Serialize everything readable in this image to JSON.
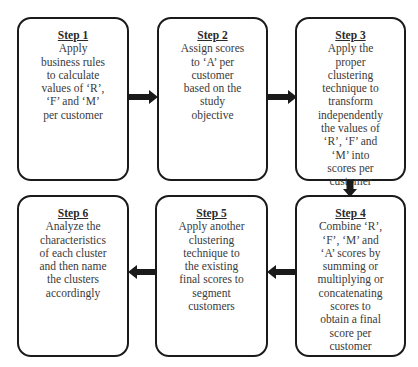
{
  "diagram": {
    "steps": [
      {
        "title": "Step 1",
        "text": "Apply\nbusiness rules\nto calculate\nvalues of ‘R’,\n‘F’ and ‘M’\nper customer"
      },
      {
        "title": "Step 2",
        "text": "Assign scores\nto ‘A’ per\ncustomer\nbased on the\nstudy\nobjective"
      },
      {
        "title": "Step 3",
        "text": "Apply the\nproper\nclustering\ntechnique to\ntransform\nindependently\nthe values of\n‘R’, ‘F’ and\n‘M’ into\nscores per\ncustomer"
      },
      {
        "title": "Step 4",
        "text": "Combine ‘R’,\n‘F’, ‘M’ and\n‘A’ scores by\nsumming or\nmultiplying or\nconcatenating\nscores to\nobtain a final\nscore per\ncustomer"
      },
      {
        "title": "Step 5",
        "text": "Apply another\nclustering\ntechnique to\nthe existing\nfinal scores to\nsegment\ncustomers"
      },
      {
        "title": "Step 6",
        "text": "Analyze the\ncharacteristics\nof each cluster\nand then name\nthe clusters\naccordingly"
      }
    ],
    "flow": [
      "Step 1 → Step 2",
      "Step 2 → Step 3",
      "Step 3 → Step 4",
      "Step 4 → Step 5",
      "Step 5 → Step 6"
    ],
    "colors": {
      "border": "#1a1a1a",
      "text": "#3a3a3a",
      "arrow": "#1a1a1a",
      "background": "#ffffff"
    }
  }
}
